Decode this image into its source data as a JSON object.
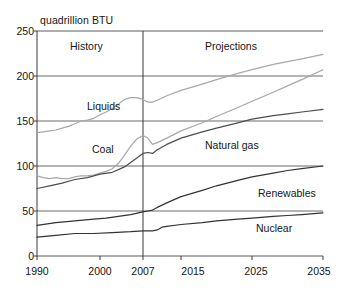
{
  "chart_data": {
    "type": "line",
    "title": "",
    "ylabel": "quadrillion BTU",
    "xlabel": "",
    "ylim": [
      0,
      250
    ],
    "yticks": [
      0,
      50,
      100,
      150,
      200,
      250
    ],
    "xticks": [
      "1990",
      "2000",
      "2007",
      "2015",
      "2025",
      "2035"
    ],
    "xtick_values": [
      1990,
      2000,
      2007,
      2015,
      2025,
      2035
    ],
    "xlim": [
      1990,
      2035
    ],
    "grid": "horizontal",
    "legend_position": "inline-annotations",
    "divider_year": 2007,
    "annotations": [
      {
        "text": "History",
        "x": 1997,
        "y": 238
      },
      {
        "text": "Projections",
        "x": 2022,
        "y": 238
      }
    ],
    "series": [
      {
        "name": "Liquids",
        "color": "#a8a8a8",
        "label_x": 2000,
        "label_y": 168,
        "x": [
          1990,
          1991,
          1992,
          1993,
          1994,
          1995,
          1996,
          1997,
          1998,
          1999,
          2000,
          2001,
          2002,
          2003,
          2004,
          2005,
          2006,
          2007,
          2008,
          2009,
          2010,
          2012,
          2015,
          2018,
          2020,
          2023,
          2025,
          2028,
          2030,
          2032,
          2035
        ],
        "values": [
          137,
          138,
          139,
          140,
          142,
          144,
          147,
          150,
          151,
          153,
          157,
          160,
          164,
          169,
          174,
          176,
          176,
          174,
          171,
          171,
          173,
          178,
          184,
          191,
          196,
          203,
          207,
          213,
          216,
          219,
          224
        ]
      },
      {
        "name": "Coal",
        "color": "#a8a8a8",
        "label_x": 1998,
        "label_y": 128,
        "x": [
          1990,
          1991,
          1992,
          1993,
          1994,
          1995,
          1996,
          1997,
          1998,
          1999,
          2000,
          2001,
          2002,
          2003,
          2004,
          2005,
          2006,
          2007,
          2008,
          2009,
          2010,
          2012,
          2015,
          2018,
          2020,
          2023,
          2025,
          2028,
          2030,
          2032,
          2035
        ],
        "values": [
          89,
          87,
          86,
          87,
          86,
          86,
          88,
          89,
          89,
          90,
          92,
          94,
          97,
          103,
          112,
          122,
          130,
          134,
          131,
          124,
          126,
          131,
          139,
          148,
          155,
          165,
          172,
          182,
          189,
          196,
          207
        ]
      },
      {
        "name": "Natural gas",
        "color": "#4d4d4d",
        "label_x": 2012,
        "label_y": 118,
        "x": [
          1990,
          1992,
          1994,
          1996,
          1998,
          2000,
          2002,
          2004,
          2005,
          2006,
          2007,
          2008,
          2009,
          2010,
          2012,
          2015,
          2018,
          2020,
          2023,
          2025,
          2028,
          2030,
          2032,
          2035
        ],
        "values": [
          75,
          78,
          81,
          85,
          87,
          91,
          93,
          99,
          104,
          109,
          114,
          115,
          114,
          118,
          124,
          131,
          138,
          142,
          148,
          152,
          156,
          158,
          160,
          163
        ]
      },
      {
        "name": "Renewables",
        "color": "#333333",
        "label_x": 2025,
        "label_y": 67,
        "x": [
          1990,
          1993,
          1996,
          1999,
          2001,
          2003,
          2005,
          2007,
          2008,
          2009,
          2010,
          2012,
          2015,
          2018,
          2020,
          2023,
          2025,
          2028,
          2030,
          2032,
          2035
        ],
        "values": [
          34,
          37,
          39,
          41,
          42,
          44,
          46,
          49,
          50,
          51,
          54,
          59,
          66,
          73,
          78,
          84,
          88,
          92,
          95,
          97,
          100
        ]
      },
      {
        "name": "Nuclear",
        "color": "#333333",
        "label_x": 2024,
        "label_y": 32,
        "x": [
          1990,
          1993,
          1996,
          1999,
          2002,
          2005,
          2007,
          2009,
          2010,
          2011,
          2012,
          2015,
          2018,
          2020,
          2023,
          2025,
          2028,
          2030,
          2032,
          2035
        ],
        "values": [
          21,
          23,
          25,
          25,
          26,
          27,
          28,
          28,
          29,
          32,
          33,
          35,
          37,
          39,
          41,
          42,
          44,
          45,
          46,
          48
        ]
      }
    ]
  },
  "labels": {
    "axis_title": "quadrillion BTU",
    "history": "History",
    "projections": "Projections",
    "liquids": "Liquids",
    "coal": "Coal",
    "natural_gas": "Natural gas",
    "renewables": "Renewables",
    "nuclear": "Nuclear",
    "y0": "0",
    "y50": "50",
    "y100": "100",
    "y150": "150",
    "y200": "200",
    "y250": "250",
    "x1990": "1990",
    "x2000": "2000",
    "x2007": "2007",
    "x2015": "2015",
    "x2025": "2025",
    "x2035": "2035"
  }
}
